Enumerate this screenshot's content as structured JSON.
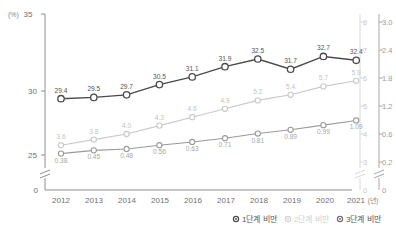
{
  "chart_data": {
    "type": "line",
    "title": "",
    "xlabel": "(년)",
    "ylabel": "(%)",
    "grid": false,
    "legend_position": "bottom",
    "categories": [
      "2012",
      "2013",
      "2014",
      "2015",
      "2016",
      "2017",
      "2018",
      "2019",
      "2020",
      "2021"
    ],
    "series": [
      {
        "name": "1단계 비만",
        "axis": "left",
        "color": "#4a4a4a",
        "values": [
          29.4,
          29.5,
          29.7,
          30.5,
          31.1,
          31.9,
          32.5,
          31.7,
          32.7,
          32.4
        ],
        "labels": [
          "29.4",
          "29.5",
          "29.7",
          "30.5",
          "31.1",
          "31.9",
          "32.5",
          "31.7",
          "32.7",
          "32.4"
        ]
      },
      {
        "name": "2단계 비만",
        "axis": "right-outer",
        "color": "#c9c9c9",
        "values": [
          3.6,
          3.8,
          4.0,
          4.3,
          4.6,
          4.9,
          5.2,
          5.4,
          5.7,
          5.9
        ],
        "labels": [
          "3.6",
          "3.8",
          "4.0",
          "4.3",
          "4.6",
          "4.9",
          "5.2",
          "5.4",
          "5.7",
          "5.9"
        ]
      },
      {
        "name": "3단계 비만",
        "axis": "right-inner",
        "color": "#9a9a9a",
        "values": [
          0.38,
          0.45,
          0.48,
          0.56,
          0.63,
          0.71,
          0.81,
          0.89,
          0.99,
          1.09
        ],
        "labels": [
          "0.38",
          "0.45",
          "0.48",
          "0.56",
          "0.63",
          "0.71",
          "0.81",
          "0.89",
          "0.99",
          "1.09"
        ]
      }
    ],
    "axes": {
      "left": {
        "unit": "(%)",
        "ticks": [
          "35",
          "30",
          "25",
          "0"
        ],
        "range": [
          25,
          35
        ],
        "broken": true
      },
      "right_outer": {
        "ticks": [
          "8",
          "7",
          "6",
          "5",
          "4",
          "3",
          "0"
        ],
        "range": [
          3,
          8
        ],
        "broken": true
      },
      "right_inner": {
        "ticks": [
          "3.0",
          "2.4",
          "1.8",
          "1.2",
          "0.6",
          "0.2",
          "0"
        ],
        "range": [
          0.2,
          3.0
        ],
        "broken": true
      },
      "x": {
        "unit": "(년)",
        "zero_label": "0"
      }
    },
    "legend": [
      {
        "label": "1단계 비만",
        "color": "#4a4a4a"
      },
      {
        "label": "2단계 비만",
        "color": "#d2d2d2"
      },
      {
        "label": "3단계 비만",
        "color": "#6f6f6f"
      }
    ]
  }
}
